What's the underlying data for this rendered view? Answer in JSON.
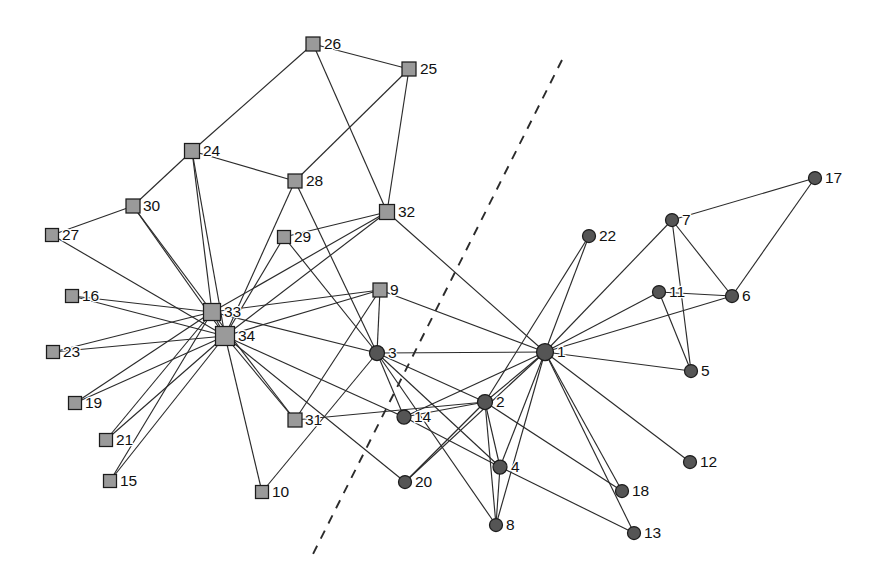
{
  "figure": {
    "width": 881,
    "height": 583,
    "background_color": "#ffffff",
    "edge_color": "#2b2b2b",
    "square_node_fill": "#9a9a9a",
    "circle_node_fill": "#555555",
    "node_outline_color": "#1c1c1c",
    "label_color": "#111111"
  },
  "divider": {
    "name": "dashed-partition-line",
    "style": "dashed",
    "color": "#2b2b2b",
    "x1": 562,
    "y1": 60,
    "x2": 312,
    "y2": 556
  },
  "chart_data": {
    "type": "scatter",
    "title": "",
    "subtitle": "",
    "xlabel": "",
    "ylabel": "",
    "grid": false,
    "legend": null,
    "graph": {
      "node_count": 34,
      "edge_count": 78,
      "shapes": {
        "square": "faction-A",
        "circle": "faction-B"
      }
    },
    "nodes": [
      {
        "id": "1",
        "label": "1",
        "x": 545,
        "y": 352,
        "shape": "circle",
        "r": 8.5,
        "label_dx": 12,
        "label_dy": 1
      },
      {
        "id": "2",
        "label": "2",
        "x": 485,
        "y": 402,
        "shape": "circle",
        "r": 7.5,
        "label_dx": 11,
        "label_dy": 1
      },
      {
        "id": "3",
        "label": "3",
        "x": 377,
        "y": 353,
        "shape": "circle",
        "r": 7.5,
        "label_dx": 11,
        "label_dy": 1
      },
      {
        "id": "4",
        "label": "4",
        "x": 500,
        "y": 467,
        "shape": "circle",
        "r": 7.0,
        "label_dx": 11,
        "label_dy": 1
      },
      {
        "id": "5",
        "label": "5",
        "x": 691,
        "y": 371,
        "shape": "circle",
        "r": 6.5,
        "label_dx": 10,
        "label_dy": 1
      },
      {
        "id": "6",
        "label": "6",
        "x": 732,
        "y": 296,
        "shape": "circle",
        "r": 6.5,
        "label_dx": 10,
        "label_dy": 1
      },
      {
        "id": "7",
        "label": "7",
        "x": 672,
        "y": 220,
        "shape": "circle",
        "r": 6.5,
        "label_dx": 10,
        "label_dy": 1
      },
      {
        "id": "8",
        "label": "8",
        "x": 496,
        "y": 525,
        "shape": "circle",
        "r": 6.5,
        "label_dx": 10,
        "label_dy": 1
      },
      {
        "id": "9",
        "label": "9",
        "x": 380,
        "y": 290,
        "shape": "square",
        "r": 7.0,
        "label_dx": 10,
        "label_dy": 1
      },
      {
        "id": "10",
        "label": "10",
        "x": 262,
        "y": 492,
        "shape": "square",
        "r": 6.5,
        "label_dx": 10,
        "label_dy": 1
      },
      {
        "id": "11",
        "label": "11",
        "x": 659,
        "y": 292,
        "shape": "circle",
        "r": 6.5,
        "label_dx": 10,
        "label_dy": 1
      },
      {
        "id": "12",
        "label": "12",
        "x": 690,
        "y": 462,
        "shape": "circle",
        "r": 6.5,
        "label_dx": 10,
        "label_dy": 1
      },
      {
        "id": "13",
        "label": "13",
        "x": 634,
        "y": 533,
        "shape": "circle",
        "r": 6.5,
        "label_dx": 10,
        "label_dy": 1
      },
      {
        "id": "14",
        "label": "14",
        "x": 404,
        "y": 417,
        "shape": "circle",
        "r": 7.0,
        "label_dx": 10,
        "label_dy": 1
      },
      {
        "id": "15",
        "label": "15",
        "x": 110,
        "y": 481,
        "shape": "square",
        "r": 6.5,
        "label_dx": 10,
        "label_dy": 1
      },
      {
        "id": "16",
        "label": "16",
        "x": 72,
        "y": 296,
        "shape": "square",
        "r": 6.5,
        "label_dx": 10,
        "label_dy": 1
      },
      {
        "id": "17",
        "label": "17",
        "x": 815,
        "y": 178,
        "shape": "circle",
        "r": 6.5,
        "label_dx": 10,
        "label_dy": 1
      },
      {
        "id": "18",
        "label": "18",
        "x": 622,
        "y": 491,
        "shape": "circle",
        "r": 6.5,
        "label_dx": 10,
        "label_dy": 1
      },
      {
        "id": "19",
        "label": "19",
        "x": 75,
        "y": 403,
        "shape": "square",
        "r": 6.5,
        "label_dx": 10,
        "label_dy": 1
      },
      {
        "id": "20",
        "label": "20",
        "x": 405,
        "y": 482,
        "shape": "circle",
        "r": 6.5,
        "label_dx": 10,
        "label_dy": 1
      },
      {
        "id": "21",
        "label": "21",
        "x": 106,
        "y": 440,
        "shape": "square",
        "r": 6.5,
        "label_dx": 10,
        "label_dy": 1
      },
      {
        "id": "22",
        "label": "22",
        "x": 589,
        "y": 236,
        "shape": "circle",
        "r": 6.5,
        "label_dx": 10,
        "label_dy": 1
      },
      {
        "id": "23",
        "label": "23",
        "x": 53,
        "y": 352,
        "shape": "square",
        "r": 6.5,
        "label_dx": 10,
        "label_dy": 1
      },
      {
        "id": "24",
        "label": "24",
        "x": 192,
        "y": 151,
        "shape": "square",
        "r": 7.5,
        "label_dx": 11,
        "label_dy": 1
      },
      {
        "id": "25",
        "label": "25",
        "x": 409,
        "y": 69,
        "shape": "square",
        "r": 7.0,
        "label_dx": 11,
        "label_dy": 1
      },
      {
        "id": "26",
        "label": "26",
        "x": 313,
        "y": 44,
        "shape": "square",
        "r": 7.0,
        "label_dx": 11,
        "label_dy": 1
      },
      {
        "id": "27",
        "label": "27",
        "x": 52,
        "y": 235,
        "shape": "square",
        "r": 6.5,
        "label_dx": 10,
        "label_dy": 1
      },
      {
        "id": "28",
        "label": "28",
        "x": 295,
        "y": 181,
        "shape": "square",
        "r": 7.0,
        "label_dx": 11,
        "label_dy": 1
      },
      {
        "id": "29",
        "label": "29",
        "x": 284,
        "y": 237,
        "shape": "square",
        "r": 6.5,
        "label_dx": 10,
        "label_dy": 1
      },
      {
        "id": "30",
        "label": "30",
        "x": 133,
        "y": 206,
        "shape": "square",
        "r": 7.0,
        "label_dx": 10,
        "label_dy": 1
      },
      {
        "id": "31",
        "label": "31",
        "x": 295,
        "y": 420,
        "shape": "square",
        "r": 7.0,
        "label_dx": 10,
        "label_dy": 1
      },
      {
        "id": "32",
        "label": "32",
        "x": 387,
        "y": 212,
        "shape": "square",
        "r": 7.5,
        "label_dx": 11,
        "label_dy": 1
      },
      {
        "id": "33",
        "label": "33",
        "x": 212,
        "y": 312,
        "shape": "square",
        "r": 8.5,
        "label_dx": 12,
        "label_dy": 1
      },
      {
        "id": "34",
        "label": "34",
        "x": 225,
        "y": 336,
        "shape": "square",
        "r": 9.5,
        "label_dx": 13,
        "label_dy": 1
      }
    ],
    "edges": [
      [
        "1",
        "2"
      ],
      [
        "1",
        "3"
      ],
      [
        "1",
        "4"
      ],
      [
        "1",
        "5"
      ],
      [
        "1",
        "6"
      ],
      [
        "1",
        "7"
      ],
      [
        "1",
        "8"
      ],
      [
        "1",
        "9"
      ],
      [
        "1",
        "11"
      ],
      [
        "1",
        "12"
      ],
      [
        "1",
        "13"
      ],
      [
        "1",
        "14"
      ],
      [
        "1",
        "18"
      ],
      [
        "1",
        "20"
      ],
      [
        "1",
        "22"
      ],
      [
        "1",
        "32"
      ],
      [
        "2",
        "3"
      ],
      [
        "2",
        "4"
      ],
      [
        "2",
        "8"
      ],
      [
        "2",
        "14"
      ],
      [
        "2",
        "18"
      ],
      [
        "2",
        "20"
      ],
      [
        "2",
        "22"
      ],
      [
        "2",
        "31"
      ],
      [
        "3",
        "4"
      ],
      [
        "3",
        "8"
      ],
      [
        "3",
        "9"
      ],
      [
        "3",
        "10"
      ],
      [
        "3",
        "14"
      ],
      [
        "3",
        "28"
      ],
      [
        "3",
        "29"
      ],
      [
        "3",
        "33"
      ],
      [
        "4",
        "8"
      ],
      [
        "4",
        "13"
      ],
      [
        "4",
        "14"
      ],
      [
        "5",
        "7"
      ],
      [
        "5",
        "11"
      ],
      [
        "6",
        "7"
      ],
      [
        "6",
        "11"
      ],
      [
        "6",
        "17"
      ],
      [
        "7",
        "17"
      ],
      [
        "9",
        "31"
      ],
      [
        "9",
        "33"
      ],
      [
        "9",
        "34"
      ],
      [
        "10",
        "34"
      ],
      [
        "14",
        "34"
      ],
      [
        "15",
        "33"
      ],
      [
        "15",
        "34"
      ],
      [
        "16",
        "33"
      ],
      [
        "16",
        "34"
      ],
      [
        "19",
        "33"
      ],
      [
        "19",
        "34"
      ],
      [
        "20",
        "34"
      ],
      [
        "21",
        "33"
      ],
      [
        "21",
        "34"
      ],
      [
        "23",
        "33"
      ],
      [
        "23",
        "34"
      ],
      [
        "24",
        "26"
      ],
      [
        "24",
        "28"
      ],
      [
        "24",
        "30"
      ],
      [
        "24",
        "33"
      ],
      [
        "24",
        "34"
      ],
      [
        "25",
        "26"
      ],
      [
        "25",
        "28"
      ],
      [
        "25",
        "32"
      ],
      [
        "26",
        "32"
      ],
      [
        "27",
        "30"
      ],
      [
        "27",
        "34"
      ],
      [
        "28",
        "34"
      ],
      [
        "29",
        "32"
      ],
      [
        "29",
        "34"
      ],
      [
        "30",
        "33"
      ],
      [
        "30",
        "34"
      ],
      [
        "31",
        "33"
      ],
      [
        "31",
        "34"
      ],
      [
        "32",
        "33"
      ],
      [
        "32",
        "34"
      ],
      [
        "33",
        "34"
      ]
    ]
  }
}
